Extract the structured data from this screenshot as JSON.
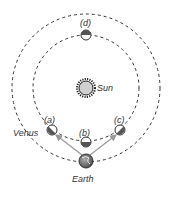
{
  "diagram": {
    "title": "",
    "sun": {
      "label": "Sun",
      "cx": 86,
      "cy": 88,
      "r": 7,
      "fill": "#d0d0d0",
      "stroke": "#222222"
    },
    "orbits": [
      {
        "name": "venus-orbit",
        "cx": 86,
        "cy": 88,
        "r": 53
      },
      {
        "name": "earth-orbit",
        "cx": 86,
        "cy": 88,
        "r": 74
      }
    ],
    "venus_positions": [
      {
        "id": "a",
        "label": "(a)",
        "cx": 52,
        "cy": 130,
        "phase": "half-lit"
      },
      {
        "id": "b",
        "label": "(b)",
        "cx": 86,
        "cy": 142,
        "phase": "crescent-lit-top"
      },
      {
        "id": "c",
        "label": "(c)",
        "cx": 120,
        "cy": 130,
        "phase": "half-lit"
      },
      {
        "id": "d",
        "label": "(d)",
        "cx": 86,
        "cy": 35,
        "phase": "full-lit-bottom"
      }
    ],
    "venus_label": "Venus",
    "earth": {
      "label": "Earth",
      "cx": 86,
      "cy": 161,
      "r": 7
    },
    "sightlines": [
      {
        "from": "Earth",
        "to": "a"
      },
      {
        "from": "Earth",
        "to": "c"
      }
    ],
    "colors": {
      "orbit": "#333333",
      "planet_dark": "#555555",
      "planet_light": "#ffffff",
      "arrow": "#999999",
      "text": "#333333"
    }
  }
}
